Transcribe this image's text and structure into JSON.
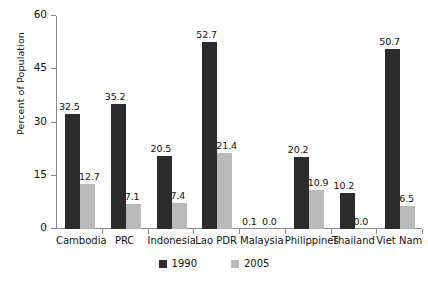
{
  "chart_data": {
    "type": "bar",
    "title": "",
    "xlabel": "",
    "ylabel": "Percent of Population",
    "ylim": [
      0,
      60
    ],
    "yticks": [
      0,
      15,
      30,
      45,
      60
    ],
    "grid": false,
    "legend_position": "bottom-center",
    "categories": [
      "Cambodia",
      "PRC",
      "Indonesia",
      "Lao PDR",
      "Malaysia",
      "Philippines",
      "Thailand",
      "Viet Nam"
    ],
    "series": [
      {
        "name": "1990",
        "color": "#2b2b2b",
        "values": [
          32.5,
          35.2,
          20.5,
          52.7,
          0.1,
          20.2,
          10.2,
          50.7
        ],
        "labels": [
          "32.5",
          "35.2",
          "20.5",
          "52.7",
          "0.1",
          "20.2",
          "10.2",
          "50.7"
        ]
      },
      {
        "name": "2005",
        "color": "#b9b9b9",
        "values": [
          12.7,
          7.1,
          7.4,
          21.4,
          0.0,
          10.9,
          0.0,
          6.5
        ],
        "labels": [
          "12.7",
          "7.1",
          "7.4",
          "21.4",
          "0.0",
          "10.9",
          "0.0",
          "6.5"
        ]
      }
    ]
  },
  "axis": {
    "y_title": "Percent of Population",
    "y_tick_labels": [
      "60",
      "45",
      "30",
      "15",
      "0"
    ]
  },
  "legend": {
    "items": [
      {
        "label": "1990",
        "color": "#2b2b2b"
      },
      {
        "label": "2005",
        "color": "#b9b9b9"
      }
    ]
  }
}
